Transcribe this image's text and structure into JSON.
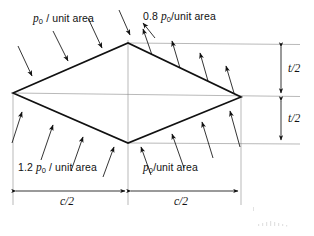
{
  "figure": {
    "type": "engineering-diagram",
    "labels": {
      "upper_left_pressure": {
        "symbol": "p",
        "subscript": "0",
        "coefficient": "",
        "suffix": "/ unit area",
        "full_text": "p0 / unit area"
      },
      "upper_right_pressure": {
        "symbol": "p",
        "subscript": "0",
        "coefficient": "0.8",
        "suffix": "/unit area",
        "full_text": "0.8 p0 /unit area"
      },
      "lower_left_pressure": {
        "symbol": "p",
        "subscript": "0",
        "coefficient": "1.2",
        "suffix": "/ unit area",
        "full_text": "1.2 p0 / unit area"
      },
      "lower_right_pressure": {
        "symbol": "p",
        "subscript": "0",
        "coefficient": "",
        "suffix": "/unit area",
        "full_text": "p0 /unit area"
      }
    },
    "dimensions": {
      "chord_left": "c/2",
      "chord_right": "c/2",
      "thickness_upper": "t/2",
      "thickness_lower": "t/2"
    },
    "geometry": {
      "left_vertex": [
        13,
        93
      ],
      "top_vertex": [
        128,
        43
      ],
      "right_vertex": [
        241,
        97
      ],
      "bottom_vertex": [
        128,
        143
      ]
    },
    "arrow_directions": {
      "upper_left_face": "inward (toward surface, pointing down-right)",
      "upper_right_face": "outward (away from surface, pointing up-right)",
      "lower_left_face": "inward (toward surface, pointing up-right)",
      "lower_right_face": "inward (toward surface, pointing up-left)"
    },
    "colors": {
      "line": "#1a1a1a",
      "thin_line": "#6f6f6f",
      "background": "#ffffff"
    }
  }
}
